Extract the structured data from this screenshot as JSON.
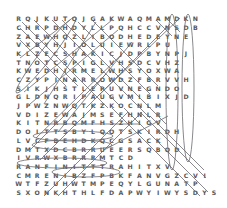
{
  "puzzle": {
    "type": "word-search-solution",
    "columns": 22,
    "rows": 21,
    "cell_width": 9.3,
    "cell_height": 8.7,
    "origin_x": 14,
    "origin_y": 15,
    "font_size": 6.2,
    "letter_color": "#58585a",
    "mark_color": "#6b6b70",
    "background": "#ffffff",
    "grid": [
      "RQJKUTQJGAKWAQMAMDKN",
      "CHRPDHDYLLPQHCCVNSDB",
      "ZAEWHQZLIBODHEDEYNE",
      "VXBYHJIOLUIEWRLPU",
      "KLZECSHAKICJDPBYNPJ",
      "TNOTCSPIGLVHSDCVHZ",
      "KWEDHIRMELWHSYOXWA",
      "CZYPINARROWDZFBRVVH",
      "SIKJHSTLEPUVNEGNDO",
      "GLDNQRIPAUGVMIBIXJD",
      "JPWZNWQTKZKOCNLM",
      "VDIZEWAJMSEFHNLR",
      "KITNRBQMFHSZHIGV",
      "DOITTSBYLQOTSKIRDH",
      "LVCFBEHDKQCGSACK",
      "DMTXDCBRRUEERSQBQD",
      "IVRWXBRRRMTCD",
      "RANFINITTTRAHITXV",
      "CMRENIBZFPBKFANVGZCVI",
      "WTFZUHWTMPEQYLGUNATP",
      "SXONKHTHLFDAPWYIWYSDYS"
    ],
    "found_word_marks": [
      {
        "id": "vertical-ellipse-1",
        "shape": "ellipse",
        "orientation": "vertical",
        "cx": 172,
        "cy": 92,
        "rx": 6,
        "ry": 78
      },
      {
        "id": "vertical-ellipse-2",
        "shape": "ellipse",
        "orientation": "vertical",
        "cx": 188,
        "cy": 88,
        "rx": 6,
        "ry": 74
      },
      {
        "id": "horizontal-ellipse-1",
        "shape": "ellipse",
        "orientation": "horizontal",
        "cx": 73,
        "cy": 136,
        "rx": 40,
        "ry": 5
      },
      {
        "id": "horizontal-ellipse-2",
        "shape": "ellipse",
        "orientation": "horizontal",
        "cx": 72,
        "cy": 145,
        "rx": 40,
        "ry": 5
      },
      {
        "id": "horizontal-ellipse-3",
        "shape": "ellipse",
        "orientation": "horizontal",
        "cx": 62,
        "cy": 163,
        "rx": 45,
        "ry": 5
      },
      {
        "id": "horizontal-ellipse-4",
        "shape": "ellipse",
        "orientation": "horizontal",
        "cx": 86,
        "cy": 172,
        "rx": 34,
        "ry": 5
      },
      {
        "id": "diagonal-ellipse-1",
        "shape": "ellipse",
        "orientation": "diagonal",
        "cx": 46,
        "cy": 55,
        "rx": 6,
        "ry": 48,
        "rotate": 38
      }
    ],
    "solution_lines": [
      {
        "id": "line-1",
        "x1": 22,
        "y1": 22,
        "x2": 108,
        "y2": 108
      },
      {
        "id": "line-2",
        "x1": 34,
        "y1": 20,
        "x2": 120,
        "y2": 106
      },
      {
        "id": "line-3",
        "x1": 52,
        "y1": 20,
        "x2": 150,
        "y2": 118
      },
      {
        "id": "line-4",
        "x1": 62,
        "y1": 20,
        "x2": 166,
        "y2": 124
      },
      {
        "id": "line-5",
        "x1": 98,
        "y1": 96,
        "x2": 180,
        "y2": 18
      },
      {
        "id": "line-6",
        "x1": 86,
        "y1": 108,
        "x2": 170,
        "y2": 24
      },
      {
        "id": "line-7",
        "x1": 24,
        "y1": 92,
        "x2": 112,
        "y2": 20
      },
      {
        "id": "line-8",
        "x1": 30,
        "y1": 104,
        "x2": 118,
        "y2": 30
      },
      {
        "id": "line-9",
        "x1": 20,
        "y1": 58,
        "x2": 70,
        "y2": 20
      },
      {
        "id": "line-10",
        "x1": 44,
        "y1": 104,
        "x2": 96,
        "y2": 22
      },
      {
        "id": "line-11",
        "x1": 58,
        "y1": 132,
        "x2": 132,
        "y2": 42
      },
      {
        "id": "line-12",
        "x1": 36,
        "y1": 138,
        "x2": 122,
        "y2": 54
      },
      {
        "id": "line-13",
        "x1": 30,
        "y1": 150,
        "x2": 106,
        "y2": 74
      },
      {
        "id": "line-14",
        "x1": 40,
        "y1": 160,
        "x2": 96,
        "y2": 104
      },
      {
        "id": "line-15",
        "x1": 44,
        "y1": 196,
        "x2": 128,
        "y2": 112
      },
      {
        "id": "line-16",
        "x1": 58,
        "y1": 196,
        "x2": 142,
        "y2": 112
      },
      {
        "id": "line-17",
        "x1": 112,
        "y1": 108,
        "x2": 200,
        "y2": 196
      },
      {
        "id": "line-18",
        "x1": 124,
        "y1": 108,
        "x2": 208,
        "y2": 192
      },
      {
        "id": "line-19",
        "x1": 140,
        "y1": 112,
        "x2": 206,
        "y2": 178
      },
      {
        "id": "line-20",
        "x1": 150,
        "y1": 116,
        "x2": 204,
        "y2": 170
      },
      {
        "id": "line-21",
        "x1": 104,
        "y1": 150,
        "x2": 168,
        "y2": 116
      },
      {
        "id": "line-22",
        "x1": 46,
        "y1": 124,
        "x2": 140,
        "y2": 124
      },
      {
        "id": "line-23",
        "x1": 92,
        "y1": 20,
        "x2": 158,
        "y2": 86
      },
      {
        "id": "line-24",
        "x1": 78,
        "y1": 22,
        "x2": 150,
        "y2": 94
      },
      {
        "id": "line-25",
        "x1": 156,
        "y1": 20,
        "x2": 172,
        "y2": 36
      },
      {
        "id": "line-26",
        "x1": 166,
        "y1": 18,
        "x2": 180,
        "y2": 32
      },
      {
        "id": "line-27",
        "x1": 20,
        "y1": 28,
        "x2": 78,
        "y2": 86
      },
      {
        "id": "line-28",
        "x1": 20,
        "y1": 40,
        "x2": 66,
        "y2": 86
      }
    ]
  }
}
